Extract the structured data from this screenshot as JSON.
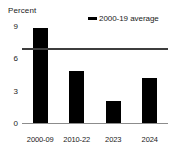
{
  "chart_data": {
    "type": "bar",
    "title": "",
    "subtitle": "",
    "xlabel": "",
    "ylabel": "Percent",
    "categories": [
      "2000-09",
      "2010-22",
      "2023",
      "2024"
    ],
    "values": [
      8.9,
      4.9,
      2.1,
      4.3
    ],
    "ylim": [
      0,
      9
    ],
    "yticks": [
      0,
      3,
      6,
      9
    ],
    "ytick_labels": [
      "0",
      "3",
      "6",
      "9"
    ],
    "grid": false,
    "legend_position": "top-right",
    "series": [
      {
        "name": "bars",
        "type": "bar",
        "color": "#000000",
        "values": [
          8.9,
          4.9,
          2.1,
          4.3
        ]
      },
      {
        "name": "2000-19 average",
        "type": "hline",
        "color": "#3d3d3d",
        "value": 6.9
      }
    ],
    "annotations": []
  },
  "axis": {
    "unit_label": "Percent",
    "y_ticks": [
      {
        "label": "9",
        "value": 9
      },
      {
        "label": "6",
        "value": 6
      },
      {
        "label": "3",
        "value": 3
      },
      {
        "label": "0",
        "value": 0
      }
    ],
    "x_ticks": [
      {
        "label": "2000-09"
      },
      {
        "label": "2010-22"
      },
      {
        "label": "2023"
      },
      {
        "label": "2024"
      }
    ]
  },
  "legend": {
    "items": [
      {
        "label": "2000-19 average",
        "marker": "line-marker",
        "color": "#000000"
      }
    ]
  },
  "colors": {
    "bar": "#000000",
    "average_line": "#3d3d3d",
    "baseline": "#8c8c8c",
    "text": "#1a1a1a",
    "background": "#ffffff"
  }
}
